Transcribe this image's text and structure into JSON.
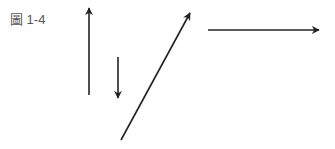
{
  "figure": {
    "caption": "圖 1-4",
    "stroke_color": "#222222",
    "arrows": [
      {
        "name": "arrow-up",
        "x1": 89,
        "y1": 95,
        "x2": 89,
        "y2": 8
      },
      {
        "name": "arrow-down",
        "x1": 118,
        "y1": 57,
        "x2": 118,
        "y2": 98
      },
      {
        "name": "arrow-diagonal",
        "x1": 121,
        "y1": 140,
        "x2": 190,
        "y2": 13
      },
      {
        "name": "arrow-right",
        "x1": 208,
        "y1": 30,
        "x2": 319,
        "y2": 30
      }
    ]
  }
}
